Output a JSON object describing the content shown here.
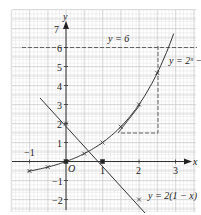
{
  "diagram": {
    "axes": {
      "x_label": "x",
      "y_label": "y",
      "origin_label": "O",
      "x_ticks": [
        {
          "value": -1,
          "label": "−1"
        },
        {
          "value": 1,
          "label": "1"
        },
        {
          "value": 2,
          "label": "2"
        },
        {
          "value": 3,
          "label": "3"
        }
      ],
      "y_ticks": [
        {
          "value": 7,
          "label": "7"
        },
        {
          "value": 6,
          "label": "6"
        },
        {
          "value": 5,
          "label": "5"
        },
        {
          "value": 4,
          "label": "4"
        },
        {
          "value": 3,
          "label": "3"
        },
        {
          "value": 2,
          "label": "2"
        },
        {
          "value": 1,
          "label": "1"
        },
        {
          "value": -1,
          "label": "−1"
        },
        {
          "value": -2,
          "label": "−2"
        }
      ]
    },
    "curves": [
      {
        "name": "exponential",
        "label": "y = 2ˣ −",
        "equation": "y = 2^x - 1"
      },
      {
        "name": "line",
        "label": "y = 2(1 − x)",
        "equation": "y = 2(1 - x)"
      }
    ],
    "asymptote_label": "y = 6",
    "tangent_note": "dashed gradient triangle on curve near x = 1.5 to 2.5"
  }
}
